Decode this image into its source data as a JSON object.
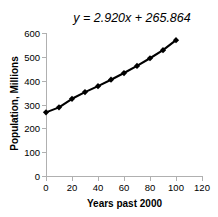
{
  "chart_data": {
    "type": "scatter",
    "title": "",
    "annotation": "y = 2.920x + 265.864",
    "xlabel": "Years past 2000",
    "ylabel": "Population, Millions",
    "xlim": [
      0,
      120
    ],
    "ylim": [
      0,
      600
    ],
    "xticks": [
      0,
      20,
      40,
      60,
      80,
      100,
      120
    ],
    "yticks": [
      0,
      100,
      200,
      300,
      400,
      500,
      600
    ],
    "grid": false,
    "legend": false,
    "marker": "diamond",
    "marker_color": "#000000",
    "line_color": "#000000",
    "trendline": {
      "slope": 2.92,
      "intercept": 265.864,
      "label": "y = 2.920x + 265.864"
    },
    "x": [
      0,
      10,
      20,
      30,
      40,
      50,
      60,
      70,
      80,
      90,
      100
    ],
    "values": [
      267,
      288,
      324,
      352,
      377,
      404,
      432,
      462,
      494,
      528,
      570
    ],
    "series": [
      {
        "name": "Population",
        "x": [
          0,
          10,
          20,
          30,
          40,
          50,
          60,
          70,
          80,
          90,
          100
        ],
        "values": [
          267,
          288,
          324,
          352,
          377,
          404,
          432,
          462,
          494,
          528,
          570
        ]
      }
    ]
  },
  "axes": {
    "x_tick_labels": [
      "0",
      "20",
      "40",
      "60",
      "80",
      "100",
      "120"
    ],
    "y_tick_labels": [
      "0",
      "100",
      "200",
      "300",
      "400",
      "500",
      "600"
    ],
    "x_title": "Years past 2000",
    "y_title": "Population, Millions"
  },
  "annotation": {
    "equation": "y = 2.920x + 265.864"
  },
  "colors": {
    "axis": "#b0b0b0",
    "text": "#000000",
    "series": "#000000",
    "background": "#ffffff"
  }
}
